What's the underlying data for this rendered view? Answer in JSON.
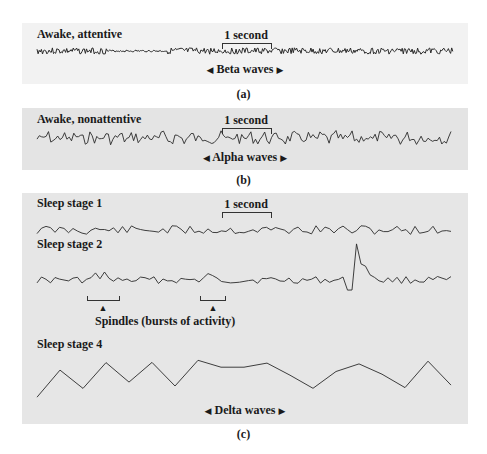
{
  "panels": {
    "a": {
      "title": "Awake, attentive",
      "scale_label": "1 second",
      "wave_label": "Beta waves",
      "figure_label": "(a)"
    },
    "b": {
      "title": "Awake, nonattentive",
      "scale_label": "1 second",
      "wave_label": "Alpha waves",
      "figure_label": "(b)"
    },
    "c": {
      "stage1_title": "Sleep stage 1",
      "scale_label": "1 second",
      "stage2_title": "Sleep stage 2",
      "spindle_label": "Spindles (bursts of activity)",
      "stage4_title": "Sleep stage 4",
      "wave_label": "Delta waves",
      "figure_label": "(c)"
    }
  },
  "arrows": {
    "left": "◀",
    "right": "▶",
    "up": "▲"
  },
  "colors": {
    "trace": "#2a2a2a",
    "panel_a_bg": "#f2f2f2",
    "panel_bc_bg": "#e5e5e5"
  },
  "traces": {
    "beta": {
      "x0": 15,
      "x1": 431,
      "baseline": 28,
      "amp": 3.2,
      "period": 2.2,
      "seed": 3,
      "quiet": [
        [
          85,
          145
        ]
      ]
    },
    "alpha": {
      "x0": 15,
      "x1": 431,
      "baseline": 30,
      "amp": 5.5,
      "period": 4.6,
      "seed": 7
    },
    "stage1": {
      "x0": 15,
      "x1": 431,
      "baseline": 37,
      "amp": 4.5,
      "period": 9,
      "seed": 11
    },
    "stage2": {
      "x0": 15,
      "x1": 431,
      "baseline": 87,
      "amp": 3.5,
      "period": 9,
      "seed": 17
    },
    "stage4": {
      "x0": 15,
      "x1": 431,
      "baseline": 178,
      "amp": 16,
      "period": 46,
      "seed": 23
    }
  }
}
